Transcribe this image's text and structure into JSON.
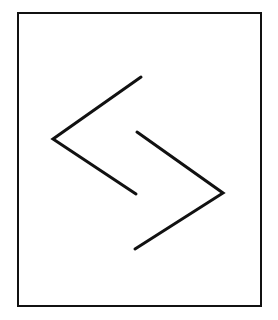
{
  "diagram": {
    "background": "#ffffff",
    "stroke_color": "#111111",
    "frame": {
      "x": 18,
      "y": 13,
      "width": 243,
      "height": 293,
      "stroke_width": 2
    },
    "left_chevron": {
      "points": [
        [
          141,
          77
        ],
        [
          53,
          139
        ],
        [
          136,
          194
        ]
      ],
      "stroke_width": 3
    },
    "right_chevron": {
      "points": [
        [
          137,
          132
        ],
        [
          223,
          193
        ],
        [
          135,
          249
        ]
      ],
      "stroke_width": 3
    }
  }
}
